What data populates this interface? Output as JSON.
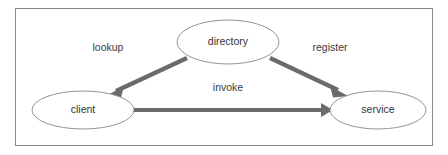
{
  "diagram": {
    "type": "service-oriented-architecture-triangle",
    "frame": {
      "border_color": "#8a8a8a",
      "background": "#ffffff",
      "x": 15,
      "y": 8,
      "width": 418,
      "height": 138
    },
    "style": {
      "node_stroke_color": "#949494",
      "node_fill": "#ffffff",
      "arrow_color": "#6b6b6b",
      "label_color": "#333333"
    },
    "nodes": [
      {
        "id": "directory",
        "label": "directory",
        "cx": 228,
        "cy": 42,
        "rx": 51,
        "ry": 22
      },
      {
        "id": "client",
        "label": "client",
        "cx": 83,
        "cy": 110,
        "rx": 51,
        "ry": 19
      },
      {
        "id": "service",
        "label": "service",
        "cx": 378,
        "cy": 110,
        "rx": 48,
        "ry": 19
      }
    ],
    "edges": [
      {
        "id": "lookup",
        "label": "lookup",
        "from": "directory",
        "to": "client",
        "label_x": 108,
        "label_y": 48,
        "x1": 187,
        "y1": 58,
        "x2": 110,
        "y2": 94
      },
      {
        "id": "register",
        "label": "register",
        "from": "directory",
        "to": "service",
        "label_x": 330,
        "label_y": 48,
        "x1": 270,
        "y1": 58,
        "x2": 344,
        "y2": 94
      },
      {
        "id": "invoke",
        "label": "invoke",
        "from": "client",
        "to": "service",
        "label_x": 228,
        "label_y": 88,
        "x1": 134,
        "y1": 110,
        "x2": 331,
        "y2": 110
      }
    ]
  }
}
